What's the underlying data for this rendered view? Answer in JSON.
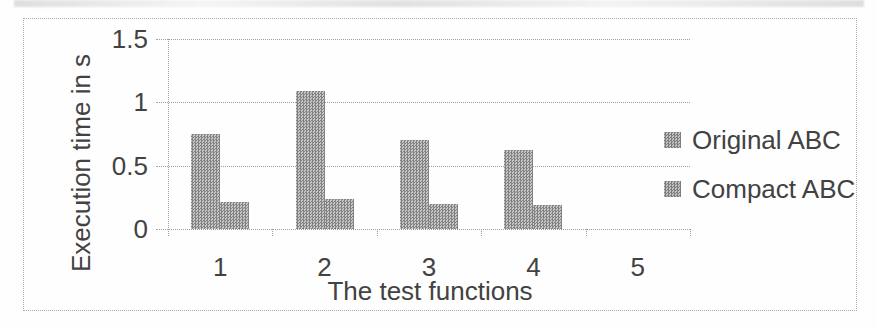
{
  "chart_data": {
    "type": "bar",
    "title": "",
    "categories": [
      "1",
      "2",
      "3",
      "4",
      "5"
    ],
    "series": [
      {
        "name": "Original ABC",
        "values": [
          0.75,
          1.09,
          0.7,
          0.62,
          0
        ]
      },
      {
        "name": "Compact ABC",
        "values": [
          0.21,
          0.24,
          0.2,
          0.19,
          0
        ]
      }
    ],
    "xlabel": "The test functions",
    "ylabel": "Execution time in s",
    "ylim": [
      0,
      1.5
    ],
    "yticks": [
      0,
      0.5,
      1,
      1.5
    ],
    "ytick_labels": [
      "0",
      "0.5",
      "1",
      "1.5"
    ],
    "grid": true,
    "legend_position": "right",
    "style": {
      "bar_fill": "halftone-gray",
      "bar_color": "#a5a5a5",
      "grid_color": "#9f9f9f",
      "text_color": "#424242",
      "figure_border": "dotted #adadad"
    }
  }
}
